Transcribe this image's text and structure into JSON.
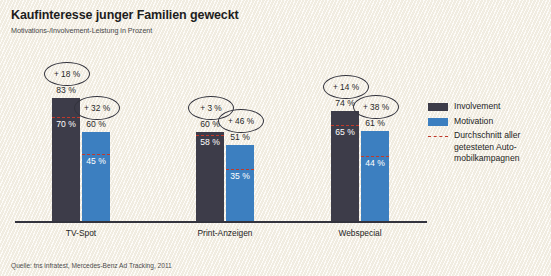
{
  "header": {
    "title": "Kaufinteresse junger Familien geweckt",
    "subtitle": "Motivations-/Involvement-Leistung in Prozent"
  },
  "footer": {
    "source": "Quelle: tns infratest, Mercedes-Benz Ad Tracking, 2011"
  },
  "legend": {
    "items": [
      {
        "label": "Involvement",
        "swatch": "involvement-swatch",
        "color": "#3d3c49"
      },
      {
        "label": "Motivation",
        "swatch": "motivation-swatch",
        "color": "#3c7fc0"
      },
      {
        "label": "Durchschnitt aller getesteten Auto-mobilkampagnen",
        "swatch": "average-dashed-swatch",
        "color": "#c0392b"
      }
    ]
  },
  "groups": [
    {
      "category": "TV-Spot",
      "involvement": {
        "value": "83 %",
        "average": "70 %",
        "delta": "+ 18 %"
      },
      "motivation": {
        "value": "60 %",
        "average": "45 %",
        "delta": "+ 32 %"
      }
    },
    {
      "category": "Print-Anzeigen",
      "involvement": {
        "value": "60 %",
        "average": "58 %",
        "delta": "+ 3 %"
      },
      "motivation": {
        "value": "51 %",
        "average": "35 %",
        "delta": "+ 46 %"
      }
    },
    {
      "category": "Webspecial",
      "involvement": {
        "value": "74 %",
        "average": "65 %",
        "delta": "+ 14 %"
      },
      "motivation": {
        "value": "61 %",
        "average": "44 %",
        "delta": "+ 38 %"
      }
    }
  ],
  "chart_data": {
    "type": "bar",
    "title": "Kaufinteresse junger Familien geweckt",
    "subtitle": "Motivations-/Involvement-Leistung in Prozent",
    "xlabel": "",
    "ylabel": "Prozent",
    "ylim": [
      0,
      100
    ],
    "grid": false,
    "legend_position": "right",
    "categories": [
      "TV-Spot",
      "Print-Anzeigen",
      "Webspecial"
    ],
    "series": [
      {
        "name": "Involvement",
        "color": "#3d3c49",
        "values": [
          83,
          60,
          74
        ]
      },
      {
        "name": "Motivation",
        "color": "#3c7fc0",
        "values": [
          60,
          51,
          61
        ]
      }
    ],
    "reference_lines": {
      "name": "Durchschnitt aller getesteten Automobilkampagnen",
      "color": "#c0392b",
      "style": "dashed",
      "involvement": [
        70,
        58,
        65
      ],
      "motivation": [
        45,
        35,
        44
      ]
    },
    "annotations": {
      "involvement_delta": [
        "+ 18 %",
        "+ 3 %",
        "+ 14 %"
      ],
      "motivation_delta": [
        "+ 32 %",
        "+ 46 %",
        "+ 38 %"
      ]
    },
    "source": "Quelle: tns infratest, Mercedes-Benz Ad Tracking, 2011"
  }
}
